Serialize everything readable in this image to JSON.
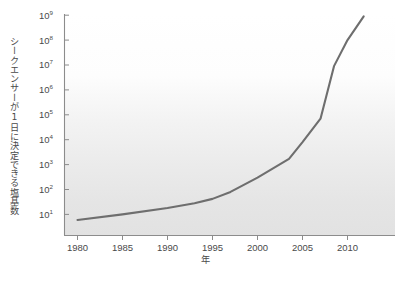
{
  "figure": {
    "background_color": "#ffffff",
    "plot_background_gradient_top": "#ffffff",
    "plot_background_gradient_bottom": "#e3e3e3",
    "axis_color": "#8c8c8c",
    "line_color": "#6e6e6e"
  },
  "chart_data": {
    "type": "line",
    "title": "",
    "subtitle": "",
    "xlabel": "年",
    "ylabel": "シークエンサーが1日に決定できる塩基数",
    "yscale": "log",
    "xlim": [
      1978,
      2013.5
    ],
    "ylim": [
      5,
      1000000000
    ],
    "grid": false,
    "legend": null,
    "xticks": [
      1980,
      1985,
      1990,
      1995,
      2000,
      2005,
      2010
    ],
    "xticklabels": [
      "1980",
      "1985",
      "1990",
      "1995",
      "2000",
      "2005",
      "2010"
    ],
    "yticks": [
      10,
      100,
      1000,
      10000,
      100000,
      1000000,
      10000000,
      100000000,
      1000000000
    ],
    "yticklabels": [
      "10¹",
      "10²",
      "10³",
      "10⁴",
      "10⁵",
      "10⁶",
      "10⁷",
      "10⁸",
      "10⁹"
    ],
    "ytick_mantissa": "10",
    "ytick_exponents": [
      "1",
      "2",
      "3",
      "4",
      "5",
      "6",
      "7",
      "8",
      "9"
    ],
    "series": [
      {
        "name": "シークエンサーが1日に決定できる塩基数",
        "color": "#6e6e6e",
        "x": [
          1980,
          1985,
          1990,
          1993,
          1995,
          1997,
          2000,
          2003.5,
          2005,
          2007,
          2008.5,
          2010,
          2011.8
        ],
        "y": [
          6,
          10,
          18,
          28,
          42,
          80,
          300,
          1700,
          8000,
          70000,
          9000000,
          100000000,
          900000000
        ]
      }
    ]
  }
}
